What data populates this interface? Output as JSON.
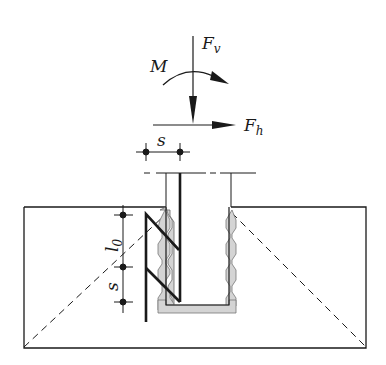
{
  "diagram": {
    "labels": {
      "vertical_force": "F",
      "vertical_force_sub": "v",
      "horizontal_force": "F",
      "horizontal_force_sub": "h",
      "moment": "M",
      "spacing_top": "s",
      "lap_length": "l",
      "lap_length_sub": "0",
      "spacing_side": "s"
    },
    "colors": {
      "line": "#1a1a1a",
      "grout_fill": "#d4d4d4",
      "background": "#ffffff"
    }
  }
}
